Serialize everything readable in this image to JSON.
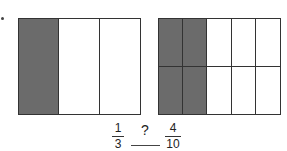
{
  "diagram": {
    "left_model": {
      "columns": 3,
      "rows": 1,
      "shaded_cells": [
        0
      ]
    },
    "right_model": {
      "columns": 5,
      "rows": 2,
      "shaded_cells": [
        0,
        1,
        5,
        6
      ]
    },
    "left_fraction": {
      "numerator": "1",
      "denominator": "3"
    },
    "comparison_symbol": "?",
    "right_fraction": {
      "numerator": "4",
      "denominator": "10"
    },
    "colors": {
      "shaded": "#6b6b6b",
      "border": "#333333",
      "background": "#ffffff"
    }
  }
}
